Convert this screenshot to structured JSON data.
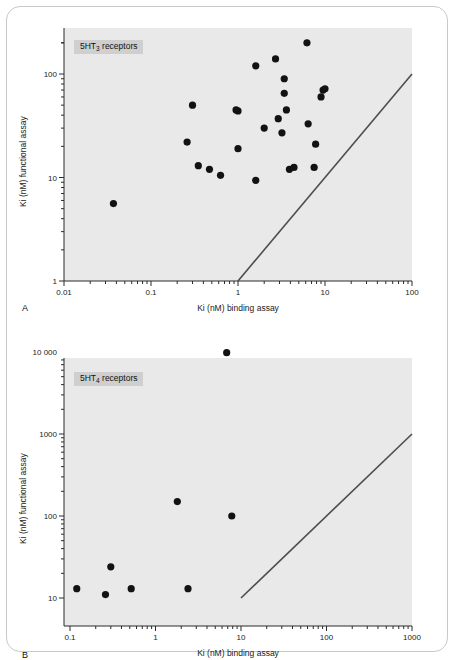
{
  "figure": {
    "frame_color": "#c9c9c9",
    "plot_background": "#e9e9e9",
    "marker_color": "#121212",
    "line_color": "#4d4d4d"
  },
  "panels": [
    {
      "letter": "A",
      "legend": "5HT3 receptors",
      "legend_base": "5HT",
      "legend_sub": "3",
      "legend_suffix": " receptors"
    },
    {
      "letter": "B",
      "legend": "5HT4 receptors",
      "legend_base": "5HT",
      "legend_sub": "4",
      "legend_suffix": " receptors"
    }
  ],
  "chart_data": [
    {
      "type": "scatter",
      "title": "5HT3 receptors",
      "panel": "A",
      "xlabel": "Ki (nM) binding assay",
      "ylabel": "Ki (nM) functional assay",
      "xscale": "log",
      "yscale": "log",
      "xlim": [
        0.01,
        100
      ],
      "ylim": [
        1,
        300
      ],
      "xticks": [
        0.01,
        0.1,
        1,
        10,
        100
      ],
      "xticklabels": [
        "0.01",
        "0.1",
        "1",
        "10",
        "100"
      ],
      "yticks": [
        1,
        10,
        100
      ],
      "yticklabels": [
        "1",
        "10",
        "100"
      ],
      "grid": false,
      "legend_position": "top-left",
      "annotations": [
        {
          "text": "identity line y = x",
          "from": [
            1,
            1
          ],
          "to": [
            100,
            100
          ]
        }
      ],
      "reference_line": {
        "x": [
          1,
          100
        ],
        "y": [
          1,
          100
        ]
      },
      "points": [
        {
          "x": 0.037,
          "y": 5.6
        },
        {
          "x": 0.26,
          "y": 22
        },
        {
          "x": 0.3,
          "y": 50
        },
        {
          "x": 0.35,
          "y": 13
        },
        {
          "x": 0.47,
          "y": 12
        },
        {
          "x": 0.63,
          "y": 10.5
        },
        {
          "x": 0.95,
          "y": 45
        },
        {
          "x": 1.0,
          "y": 44
        },
        {
          "x": 1.0,
          "y": 19
        },
        {
          "x": 1.6,
          "y": 9.4
        },
        {
          "x": 1.6,
          "y": 120
        },
        {
          "x": 2.0,
          "y": 30
        },
        {
          "x": 2.7,
          "y": 140
        },
        {
          "x": 2.9,
          "y": 37
        },
        {
          "x": 3.2,
          "y": 27
        },
        {
          "x": 3.4,
          "y": 90
        },
        {
          "x": 3.4,
          "y": 65
        },
        {
          "x": 3.6,
          "y": 45
        },
        {
          "x": 3.9,
          "y": 12
        },
        {
          "x": 4.4,
          "y": 12.5
        },
        {
          "x": 6.2,
          "y": 200
        },
        {
          "x": 6.4,
          "y": 33
        },
        {
          "x": 7.8,
          "y": 21
        },
        {
          "x": 9.0,
          "y": 60
        },
        {
          "x": 9.5,
          "y": 70
        },
        {
          "x": 10.0,
          "y": 72
        },
        {
          "x": 7.5,
          "y": 12.5
        }
      ]
    },
    {
      "type": "scatter",
      "title": "5HT4 receptors",
      "panel": "B",
      "xlabel": "Ki (nM) binding assay",
      "ylabel": "Ki (nM) functional assay",
      "xscale": "log",
      "yscale": "log",
      "xlim": [
        0.09,
        1400
      ],
      "ylim": [
        10,
        15000
      ],
      "xticks": [
        0.1,
        1,
        10,
        100,
        1000
      ],
      "xticklabels": [
        "0.1",
        "1",
        "10",
        "100",
        "1000"
      ],
      "yticks": [
        10,
        100,
        1000,
        10000
      ],
      "yticklabels": [
        "10",
        "100",
        "1000",
        "10 000"
      ],
      "grid": false,
      "legend_position": "top-left",
      "annotations": [
        {
          "text": "identity line y = x",
          "from": [
            10,
            10
          ],
          "to": [
            1000,
            1000
          ]
        }
      ],
      "reference_line": {
        "x": [
          10,
          1000
        ],
        "y": [
          10,
          1000
        ]
      },
      "points": [
        {
          "x": 0.12,
          "y": 13
        },
        {
          "x": 0.26,
          "y": 11
        },
        {
          "x": 0.3,
          "y": 24
        },
        {
          "x": 0.52,
          "y": 13
        },
        {
          "x": 1.8,
          "y": 150
        },
        {
          "x": 2.4,
          "y": 13
        },
        {
          "x": 6.8,
          "y": 9800
        },
        {
          "x": 7.8,
          "y": 100
        }
      ]
    }
  ]
}
